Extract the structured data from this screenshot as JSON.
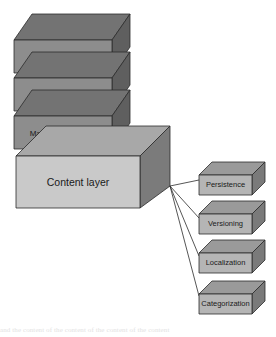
{
  "diagram": {
    "type": "3d-block-stack",
    "colors": {
      "stack_front": "#8d8d8d",
      "stack_top": "#737373",
      "stack_side": "#5f5f5f",
      "content_front": "#c9c9c9",
      "content_top": "#a8a8a8",
      "content_side": "#7b7b7b",
      "module_front": "#b5b5b5",
      "module_top": "#9a9a9a",
      "module_side": "#7a7a7a",
      "outline": "#2b2b2b",
      "connector": "#2b2b2b",
      "label_text": "#1a1a1a",
      "background": "#ffffff"
    },
    "stack": [
      {
        "id": "client-layer",
        "label": "Client layer",
        "font_size": 8
      },
      {
        "id": "publishing-layer",
        "label": "Publishing layer",
        "font_size": 8
      },
      {
        "id": "management-layer",
        "label": "Management layer",
        "font_size": 8
      },
      {
        "id": "content-layer",
        "label": "Content layer",
        "font_size": 10.5
      }
    ],
    "modules": [
      {
        "id": "persistence",
        "label": "Persistence",
        "font_size": 7.5
      },
      {
        "id": "versioning",
        "label": "Versioning",
        "font_size": 7.5
      },
      {
        "id": "localization",
        "label": "Localization",
        "font_size": 7.5
      },
      {
        "id": "categorization",
        "label": "Categorization",
        "font_size": 7.5
      }
    ],
    "connector_origin": {
      "x": 170,
      "y": 186
    },
    "caption_fragment": "and the content of the content of the content of the content"
  }
}
